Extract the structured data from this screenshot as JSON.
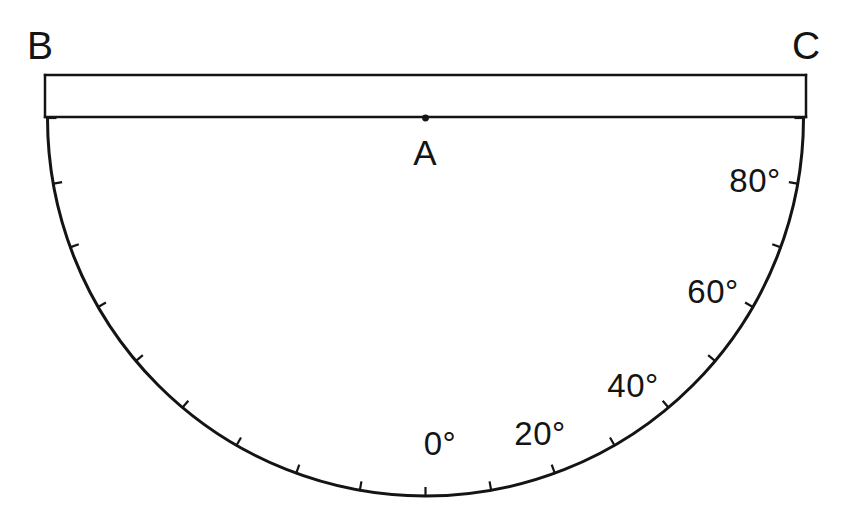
{
  "figure": {
    "background_color": "#ffffff",
    "stroke_color": "#141414",
    "vertex_labels": {
      "left": "B",
      "right": "C",
      "center": "A"
    },
    "angle_labels": [
      {
        "text": "0°",
        "degrees": 0
      },
      {
        "text": "20°",
        "degrees": 20
      },
      {
        "text": "40°",
        "degrees": 40
      },
      {
        "text": "60°",
        "degrees": 60
      },
      {
        "text": "80°",
        "degrees": 80
      }
    ]
  },
  "chart_data": {
    "type": "scatter",
    "xlabel": "",
    "ylabel": "",
    "grid": false,
    "legend": false,
    "geometry": {
      "center": {
        "name": "A",
        "x": 425.5,
        "y": 118
      },
      "radius": 378,
      "arc_start_angle_deg": -90,
      "arc_end_angle_deg": 90,
      "band": {
        "top_y": 75,
        "bottom_y": 117,
        "left_x": 45,
        "right_x": 806,
        "height": 42
      },
      "endpoints": [
        {
          "name": "B",
          "x": 45,
          "y": 118
        },
        {
          "name": "C",
          "x": 806,
          "y": 118
        }
      ],
      "arc_bottom": {
        "x": 425.5,
        "y": 490
      }
    },
    "ticks": {
      "interval_deg": 10,
      "length_px": 9,
      "values": [
        -90,
        -80,
        -70,
        -60,
        -50,
        -40,
        -30,
        -20,
        -10,
        0,
        10,
        20,
        30,
        40,
        50,
        60,
        70,
        80,
        90
      ],
      "labeled_values": [
        0,
        20,
        40,
        60,
        80
      ],
      "labels": [
        "0°",
        "20°",
        "40°",
        "60°",
        "80°"
      ],
      "zero_position": "bottom-center",
      "positive_direction": "toward C (right)"
    },
    "annotations": [
      {
        "text": "B",
        "x": 40,
        "y": 45,
        "role": "left-endpoint-label"
      },
      {
        "text": "C",
        "x": 806,
        "y": 45,
        "role": "right-endpoint-label"
      },
      {
        "text": "A",
        "x": 425,
        "y": 152,
        "role": "center-point-label"
      },
      {
        "text": "0°",
        "x": 440,
        "y": 443,
        "role": "angle-tick-label"
      },
      {
        "text": "20°",
        "x": 540,
        "y": 433,
        "role": "angle-tick-label"
      },
      {
        "text": "40°",
        "x": 633,
        "y": 385,
        "role": "angle-tick-label"
      },
      {
        "text": "60°",
        "x": 713,
        "y": 291,
        "role": "angle-tick-label"
      },
      {
        "text": "80°",
        "x": 755,
        "y": 180,
        "role": "angle-tick-label"
      }
    ]
  }
}
